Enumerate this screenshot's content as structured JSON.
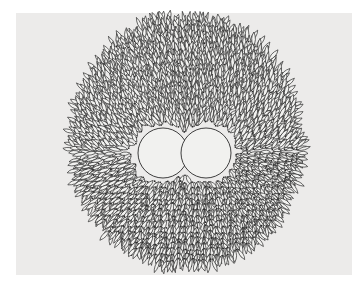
{
  "artwork": {
    "description": "Line drawing of a circular field of radiating chevron/leaf strokes (knit-stitch-like) with two tangent circular voids at the center",
    "colors": {
      "page": "#ffffff",
      "panel": "#ecebea",
      "stroke": "#2a2a2a",
      "leaf_fill": "#f2f2f0",
      "hole_fill": "#f1f1ef"
    },
    "circle": {
      "cx": 186,
      "cy": 142,
      "rx": 112,
      "ry": 122
    },
    "holes": [
      {
        "cx": 163,
        "cy": 153,
        "r": 25
      },
      {
        "cx": 206,
        "cy": 153,
        "r": 25
      }
    ]
  }
}
